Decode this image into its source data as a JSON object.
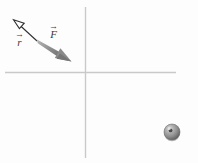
{
  "figure": {
    "background_color": "#fdfdfd",
    "width": 198,
    "height": 163
  },
  "axes": {
    "name": "coordinate-axes",
    "color": "#c9c9c9",
    "origin": {
      "x": 85,
      "y": 72
    },
    "horizontal": {
      "x1": 5,
      "y1": 72,
      "x2": 176,
      "y2": 72
    },
    "vertical": {
      "x1": 85,
      "y1": 7,
      "x2": 85,
      "y2": 158
    }
  },
  "vectors": [
    {
      "name": "position-vector-r",
      "label": "r",
      "accent": "→",
      "style": "thin-outlined-arrowhead",
      "color": "#2f2f2f",
      "tail": {
        "x": 37,
        "y": 41
      },
      "tip": {
        "x": 14,
        "y": 20
      },
      "label_position": {
        "x": 15,
        "y": 32
      }
    },
    {
      "name": "force-vector-F",
      "label": "F",
      "accent": "→",
      "style": "thick-solid-gray",
      "color": "#8a8a8a",
      "tail": {
        "x": 37,
        "y": 41
      },
      "tip": {
        "x": 71,
        "y": 61
      },
      "label_position": {
        "x": 49,
        "y": 24
      }
    }
  ],
  "particle": {
    "name": "particle-sphere",
    "center": {
      "x": 172,
      "y": 132
    },
    "radius": 8,
    "body_color": "#8c8c8c",
    "shadow_color": "#5a5a5a",
    "highlight_color": "#d8d8d8",
    "center_dot_color": "#4a4a4a"
  },
  "colors": {
    "axis": "#c9c9c9",
    "r_vector": "#2f2f2f",
    "F_vector": "#8a8a8a",
    "label_text": "#3a3a3a",
    "page_background": "#fdfdfd"
  }
}
